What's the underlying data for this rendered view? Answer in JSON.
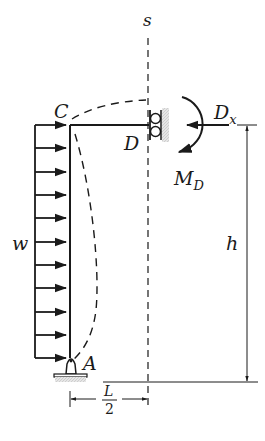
{
  "figure": {
    "type": "structural-frame-free-body",
    "labels": {
      "s": "s",
      "C": "C",
      "D": "D",
      "Dx_main": "D",
      "Dx_sub": "x",
      "MD_main": "M",
      "MD_sub": "D",
      "w": "w",
      "h": "h",
      "A": "A",
      "L_num": "L",
      "L_den": "2"
    },
    "colors": {
      "ink": "#1a1a1a",
      "hatch": "#c8c8c8",
      "background": "#ffffff"
    },
    "load": {
      "name": "w",
      "arrow_count": 11,
      "direction": "right"
    }
  }
}
